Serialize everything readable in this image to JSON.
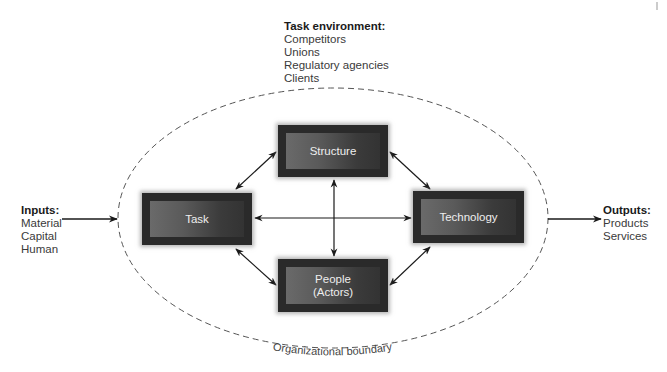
{
  "task_environment": {
    "header": "Task environment:",
    "items": [
      "Competitors",
      "Unions",
      "Regulatory agencies",
      "Clients"
    ]
  },
  "inputs": {
    "header": "Inputs:",
    "items": [
      "Material",
      "Capital",
      "Human"
    ]
  },
  "outputs": {
    "header": "Outputs:",
    "items": [
      "Products",
      "Services"
    ]
  },
  "boxes": {
    "structure": "Structure",
    "task": "Task",
    "technology": "Technology",
    "people_line1": "People",
    "people_line2": "(Actors)"
  },
  "boundary_label": "Organizational boundary",
  "colors": {
    "box_outer": "#2a2a2a",
    "box_inner": "#5e5e5e",
    "box_text": "#eeeeee",
    "arrow": "#1a1a1a",
    "boundary": "#555555"
  }
}
